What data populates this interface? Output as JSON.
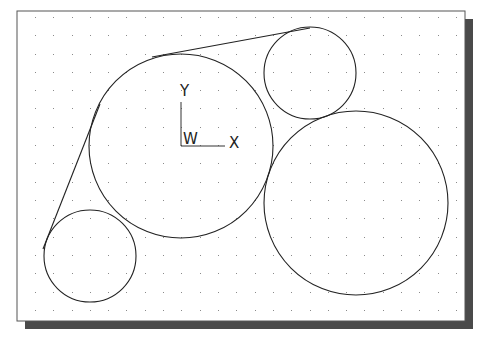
{
  "drawing": {
    "frame": {
      "x": 17,
      "y": 11,
      "width": 448,
      "height": 310,
      "border_color": "#555555",
      "background": "#ffffff"
    },
    "shadow": {
      "offset": 8,
      "color": "#4a4a4a"
    },
    "grid": {
      "start_x": 35,
      "start_y": 17,
      "spacing": 18.3,
      "dot_color": "#8a8a8a"
    },
    "circles": [
      {
        "name": "large-left-circle",
        "cx": 181,
        "cy": 146,
        "r": 92
      },
      {
        "name": "large-right-circle",
        "cx": 356,
        "cy": 203,
        "r": 92
      },
      {
        "name": "small-top-right-circle",
        "cx": 310,
        "cy": 73,
        "r": 46
      },
      {
        "name": "small-bottom-left-circle",
        "cx": 90,
        "cy": 256,
        "r": 46
      }
    ],
    "lines": [
      {
        "name": "top-tangent-line",
        "x1": 152,
        "y1": 57,
        "x2": 310,
        "y2": 28
      },
      {
        "name": "left-tangent-line",
        "x1": 100,
        "y1": 104,
        "x2": 43,
        "y2": 249
      }
    ],
    "stroke_color": "#222222",
    "ucs_icon": {
      "origin_x": 181,
      "origin_y": 146,
      "y_label": "Y",
      "x_label": "X",
      "w_label": "W"
    }
  }
}
